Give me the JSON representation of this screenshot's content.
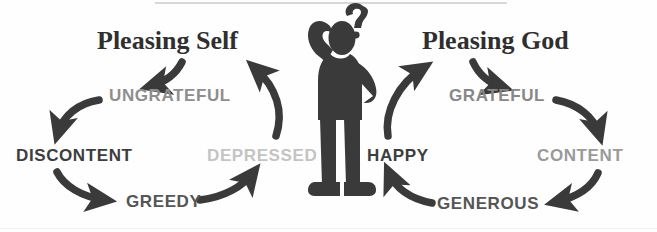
{
  "diagram": {
    "title_left": "Pleasing Self",
    "title_right": "Pleasing God",
    "center_figure": "confused-person-with-question-mark",
    "left_cycle": {
      "heading": "Pleasing Self",
      "nodes": [
        {
          "label": "UNGRATEFUL",
          "color": "#8e8e8e"
        },
        {
          "label": "DISCONTENT",
          "color": "#3d3d3d"
        },
        {
          "label": "GREEDY",
          "color": "#555555"
        },
        {
          "label": "DEPRESSED",
          "color": "#c4c4c4"
        }
      ]
    },
    "right_cycle": {
      "heading": "Pleasing God",
      "nodes": [
        {
          "label": "GRATEFUL",
          "color": "#888888"
        },
        {
          "label": "CONTENT",
          "color": "#9a9a9a"
        },
        {
          "label": "GENEROUS",
          "color": "#555555"
        },
        {
          "label": "HAPPY",
          "color": "#3d3d3d"
        }
      ]
    },
    "arrow_color": "#3a3a3a",
    "figure_color": "#3a3a3a",
    "background": "#fefefe"
  }
}
